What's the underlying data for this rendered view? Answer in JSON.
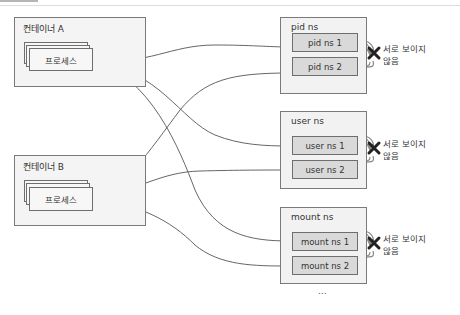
{
  "containers": [
    {
      "label": "컨테이너 A",
      "process_label": "프로세스"
    },
    {
      "label": "컨테이너 B",
      "process_label": "프로세스"
    }
  ],
  "namespaces": [
    {
      "title": "pid ns",
      "items": [
        "pid ns 1",
        "pid ns 2"
      ],
      "isolation_label_line1": "서로 보이지",
      "isolation_label_line2": "않음"
    },
    {
      "title": "user ns",
      "items": [
        "user ns 1",
        "user ns 2"
      ],
      "isolation_label_line1": "서로 보이지",
      "isolation_label_line2": "않음"
    },
    {
      "title": "mount ns",
      "items": [
        "mount ns 1",
        "mount ns 2"
      ],
      "isolation_label_line1": "서로 보이지",
      "isolation_label_line2": "않음"
    }
  ],
  "connections": [
    {
      "from": "컨테이너 A",
      "to": "pid ns 1"
    },
    {
      "from": "컨테이너 A",
      "to": "user ns 1"
    },
    {
      "from": "컨테이너 A",
      "to": "mount ns 1"
    },
    {
      "from": "컨테이너 B",
      "to": "pid ns 2"
    },
    {
      "from": "컨테이너 B",
      "to": "user ns 2"
    },
    {
      "from": "컨테이너 B",
      "to": "mount ns 2"
    }
  ],
  "more_indicator": "...",
  "colors": {
    "line": "#555555",
    "cross": "#222222",
    "ns_item_fill": "#d9d9d9",
    "box_fill": "#f2f2f2"
  }
}
